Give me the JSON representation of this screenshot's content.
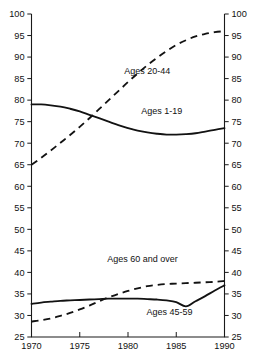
{
  "chart_data": {
    "type": "line",
    "title": "",
    "subtitle": "",
    "xlabel": "",
    "ylabel": "",
    "xlim": [
      1970,
      1990
    ],
    "ylim": [
      25,
      100
    ],
    "grid": false,
    "legend_position": "inline-labels",
    "dual_y_axis": true,
    "x_ticks": [
      1970,
      1975,
      1980,
      1985,
      1990
    ],
    "x_tick_labels": [
      "1970",
      "1975",
      "1980",
      "1985",
      "1990"
    ],
    "y_ticks": [
      25,
      30,
      35,
      40,
      45,
      50,
      55,
      60,
      65,
      70,
      75,
      80,
      85,
      90,
      95,
      100
    ],
    "y_tick_labels": [
      "25",
      "30",
      "35",
      "40",
      "45",
      "50",
      "55",
      "60",
      "65",
      "70",
      "75",
      "80",
      "85",
      "90",
      "95",
      "100"
    ],
    "x": [
      1970,
      1971,
      1972,
      1973,
      1974,
      1975,
      1976,
      1977,
      1978,
      1979,
      1980,
      1981,
      1982,
      1983,
      1984,
      1985,
      1986,
      1987,
      1988,
      1989,
      1990
    ],
    "series": [
      {
        "name": "Ages 20-44",
        "style": "dashed",
        "label": "Ages 20-44",
        "label_x": 1982.0,
        "label_y": 86.0,
        "values": [
          65.0,
          66.6,
          68.3,
          70.1,
          71.9,
          73.8,
          75.8,
          77.9,
          80.0,
          82.1,
          84.2,
          86.2,
          88.1,
          89.8,
          91.4,
          92.8,
          93.9,
          94.8,
          95.4,
          95.8,
          96.0
        ]
      },
      {
        "name": "Ages 1-19",
        "style": "solid",
        "label": "Ages 1-19",
        "label_x": 1983.5,
        "label_y": 76.8,
        "values": [
          79.0,
          79.0,
          78.8,
          78.5,
          78.0,
          77.4,
          76.6,
          75.8,
          75.0,
          74.2,
          73.5,
          72.9,
          72.5,
          72.2,
          72.0,
          72.0,
          72.1,
          72.3,
          72.7,
          73.1,
          73.5
        ]
      },
      {
        "name": "Ages 60 and over",
        "style": "dashed",
        "label": "Ages 60 and over",
        "label_x": 1981.5,
        "label_y": 42.5,
        "values": [
          28.6,
          28.9,
          29.3,
          29.9,
          30.6,
          31.4,
          32.3,
          33.3,
          34.2,
          35.0,
          35.7,
          36.3,
          36.8,
          37.1,
          37.3,
          37.4,
          37.5,
          37.6,
          37.7,
          37.8,
          38.0
        ]
      },
      {
        "name": "Ages 45-59",
        "style": "solid",
        "label": "Ages 45-59",
        "label_x": 1984.3,
        "label_y": 30.2,
        "values": [
          32.7,
          33.0,
          33.2,
          33.4,
          33.5,
          33.6,
          33.7,
          33.8,
          33.9,
          33.9,
          33.9,
          33.9,
          33.8,
          33.7,
          33.5,
          33.1,
          32.1,
          33.3,
          34.5,
          35.8,
          37.0
        ]
      }
    ]
  }
}
